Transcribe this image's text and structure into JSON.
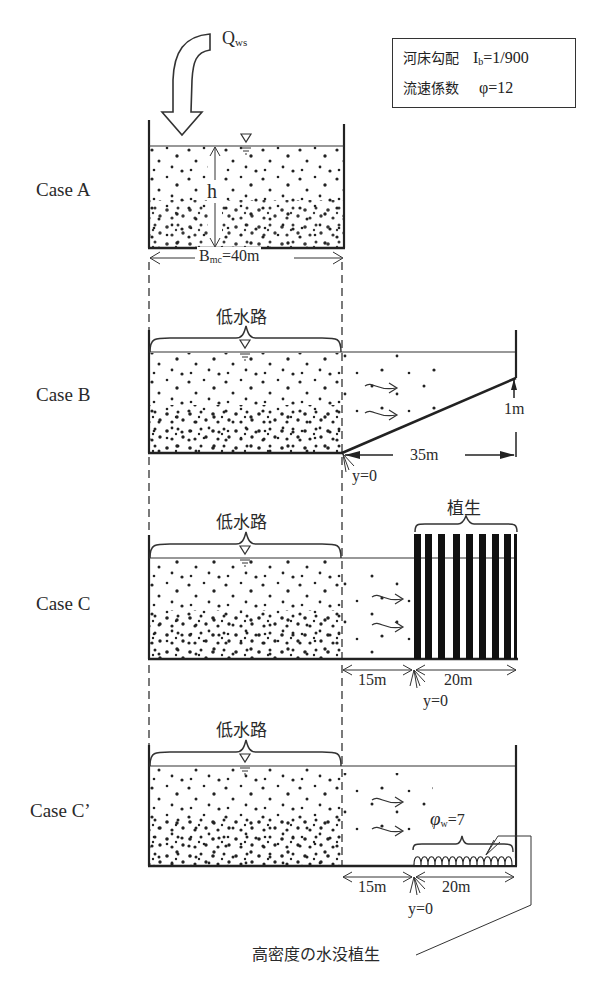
{
  "legend": {
    "rows": [
      {
        "key": "河床勾配",
        "symbol": "I",
        "sub": "b",
        "value": "=1/900"
      },
      {
        "key": "流速係数",
        "symbol": "φ",
        "sub": "",
        "value": "=12"
      }
    ]
  },
  "inflow": {
    "symbol": "Q",
    "sub": "ws"
  },
  "cases": [
    {
      "label": "Case  A"
    },
    {
      "label": "Case  B"
    },
    {
      "label": "Case  C"
    },
    {
      "label": "Case  C’"
    }
  ],
  "case_a": {
    "depth_label": "h",
    "width_symbol": "B",
    "width_sub": "mc",
    "width_value": "=40m"
  },
  "case_b": {
    "channel_label": "低水路",
    "height_label": "1m",
    "length_label": "35m",
    "origin_label": "y=0"
  },
  "case_c": {
    "channel_label": "低水路",
    "vegetation_label": "植生",
    "gap_label": "15m",
    "veg_width_label": "20m",
    "origin_label": "y=0"
  },
  "case_c2": {
    "channel_label": "低水路",
    "phi_symbol": "φ",
    "phi_sub": "w",
    "phi_value": "=7",
    "gap_label": "15m",
    "veg_width_label": "20m",
    "origin_label": "y=0",
    "callout_label": "高密度の水没植生"
  }
}
